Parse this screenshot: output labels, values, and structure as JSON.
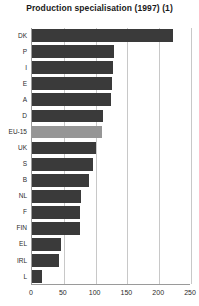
{
  "chart_data": {
    "type": "bar",
    "orientation": "horizontal",
    "title": "Production specialisation (1997) (1)",
    "xlabel": "",
    "ylabel": "",
    "xlim": [
      0,
      250
    ],
    "xticks": [
      0,
      50,
      100,
      150,
      200,
      250
    ],
    "grid": true,
    "legend": null,
    "categories": [
      "DK",
      "P",
      "I",
      "E",
      "A",
      "D",
      "EU-15",
      "UK",
      "S",
      "B",
      "NL",
      "F",
      "FIN",
      "EL",
      "IRL",
      "L"
    ],
    "values": [
      222,
      129,
      127,
      126,
      124,
      112,
      110,
      101,
      96,
      90,
      77,
      75,
      75,
      46,
      42,
      16
    ],
    "highlight_category": "EU-15",
    "colors": {
      "bar": "#3a3a3a",
      "bar_highlight": "#969696",
      "gridline": "#c8c8c8",
      "axis": "#9a9a9a",
      "text": "#2b2b2b",
      "title": "#1a1a1a",
      "background": "#ffffff"
    }
  }
}
